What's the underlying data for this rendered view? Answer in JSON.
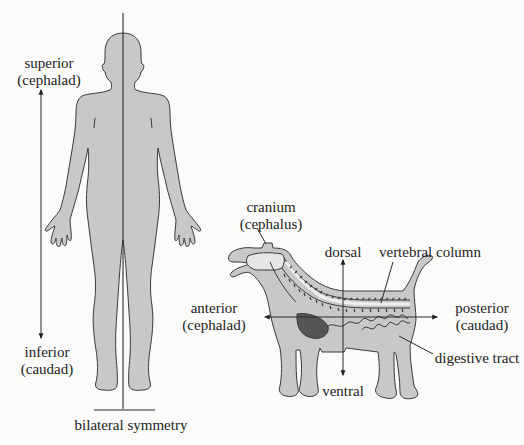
{
  "figure": {
    "domain": "anatomical directional terms",
    "colors": {
      "background": "#fbfbfa",
      "body_fill": "#c8c8c8",
      "outline": "#3a3a3a",
      "organ_dark": "#555555",
      "text": "#222222"
    }
  },
  "human": {
    "superior": {
      "term": "superior",
      "synonym": "(cephalad)"
    },
    "inferior": {
      "term": "inferior",
      "synonym": "(caudad)"
    },
    "symmetry_caption": "bilateral symmetry"
  },
  "dog": {
    "cranium": {
      "term": "cranium",
      "synonym": "(cephalus)"
    },
    "dorsal": "dorsal",
    "ventral": "ventral",
    "vertebral_column": "vertebral column",
    "anterior": {
      "term": "anterior",
      "synonym": "(cephalad)"
    },
    "posterior": {
      "term": "posterior",
      "synonym": "(caudad)"
    },
    "digestive_tract": "digestive tract"
  }
}
